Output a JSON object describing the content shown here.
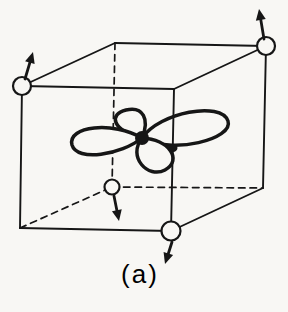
{
  "figure": {
    "background_color": "#f8f7f4",
    "ink_color": "#161616"
  },
  "caption": {
    "label": "(a)"
  },
  "cube": {
    "vertices": {
      "front_top_left": [
        22,
        86
      ],
      "front_top_right": [
        174,
        89
      ],
      "front_bottom_left": [
        20,
        228
      ],
      "front_bottom_right": [
        171,
        231
      ],
      "back_top_left": [
        115,
        43
      ],
      "back_top_right": [
        266,
        46
      ],
      "back_bottom_left": [
        112,
        187
      ],
      "back_bottom_right": [
        263,
        188
      ]
    },
    "edges": [
      {
        "from": "front_top_left",
        "to": "front_top_right",
        "style": "solid"
      },
      {
        "from": "front_top_left",
        "to": "back_top_left",
        "style": "solid"
      },
      {
        "from": "back_top_left",
        "to": "back_top_right",
        "style": "solid"
      },
      {
        "from": "front_top_right",
        "to": "back_top_right",
        "style": "solid"
      },
      {
        "from": "front_top_left",
        "to": "front_bottom_left",
        "style": "solid"
      },
      {
        "from": "front_top_right",
        "to": "front_bottom_right",
        "style": "solid"
      },
      {
        "from": "back_top_right",
        "to": "back_bottom_right",
        "style": "solid"
      },
      {
        "from": "front_bottom_left",
        "to": "front_bottom_right",
        "style": "solid"
      },
      {
        "from": "front_bottom_right",
        "to": "back_bottom_right",
        "style": "solid"
      },
      {
        "from": "back_top_left",
        "to": "back_bottom_left",
        "style": "dashed"
      },
      {
        "from": "back_bottom_left",
        "to": "back_bottom_right",
        "style": "dashed"
      },
      {
        "from": "front_bottom_left",
        "to": "back_bottom_left",
        "style": "dashed"
      }
    ],
    "solid_stroke_width": 1.9,
    "dashed_stroke_width": 1.7,
    "dash_pattern": "6.5 5"
  },
  "atoms": [
    {
      "name": "ion-front-top-left",
      "vertex": "front_top_left",
      "radius": 9
    },
    {
      "name": "ion-back-top-right",
      "vertex": "back_top_right",
      "radius": 9
    },
    {
      "name": "ion-back-bottom-left",
      "vertex": "back_bottom_left",
      "radius": 7.5
    },
    {
      "name": "ion-front-bottom-right",
      "vertex": "front_bottom_right",
      "radius": 9.5
    }
  ],
  "atom_stroke_width": 2.2,
  "arrows": [
    {
      "name": "arrow-front-top-left",
      "from": [
        25,
        79
      ],
      "to": [
        33,
        52
      ]
    },
    {
      "name": "arrow-back-top-right",
      "from": [
        264,
        39
      ],
      "to": [
        259,
        9
      ]
    },
    {
      "name": "arrow-back-bottom-left",
      "from": [
        114,
        196
      ],
      "to": [
        119,
        221
      ]
    },
    {
      "name": "arrow-front-bottom-right",
      "from": [
        172,
        242
      ],
      "to": [
        165,
        264
      ]
    }
  ],
  "arrow_style": {
    "shaft_width": 2.8,
    "head_length": 11,
    "head_half_width": 5
  },
  "orbital": {
    "center": [
      142,
      138
    ],
    "nucleus_radius": 7,
    "stroke_width": 3.5,
    "lobes": [
      {
        "name": "upper",
        "path": "M142,138 C150,119 143,106 126,110 C109,114 111,130 142,138 Z"
      },
      {
        "name": "right",
        "path": "M142,138 C160,112 221,101 228,121 C234,139 172,155 142,138 Z"
      },
      {
        "name": "left",
        "path": "M142,138 C113,121 67,126 72,145 C77,162 121,155 142,138 Z"
      },
      {
        "name": "lower",
        "path": "M142,138 C169,139 183,160 165,170 C148,179 127,157 142,138 Z"
      }
    ],
    "ink_spot": {
      "center": [
        173,
        148
      ],
      "rx": 4.5,
      "ry": 4
    }
  }
}
